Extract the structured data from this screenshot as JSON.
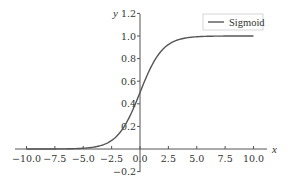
{
  "chart_data": {
    "type": "line",
    "title": "",
    "xlabel": "x",
    "ylabel": "y",
    "xlim": [
      -10.5,
      11
    ],
    "ylim": [
      -0.2,
      1.2
    ],
    "x_ticks": [
      "−10.0",
      "−7.5",
      "−5.0",
      "−2.5",
      "0.0",
      "2.5",
      "5.0",
      "7.5",
      "10.0"
    ],
    "y_ticks": [
      "−0.2",
      "0.2",
      "0.4",
      "0.6",
      "0.8",
      "1.0",
      "1.2"
    ],
    "grid": false,
    "legend_position": "upper right",
    "series": [
      {
        "name": "Sigmoid",
        "function": "1/(1+exp(-x))",
        "x": [
          -10,
          -7.5,
          -5,
          -2.5,
          0,
          2.5,
          5,
          7.5,
          10
        ],
        "values": [
          4.54e-05,
          0.000553,
          0.00669,
          0.0759,
          0.5,
          0.924,
          0.9933,
          0.99945,
          0.99995
        ],
        "color": "#555555"
      }
    ]
  },
  "legend": {
    "label": "Sigmoid"
  },
  "axes": {
    "x_name": "x",
    "y_name": "y"
  }
}
